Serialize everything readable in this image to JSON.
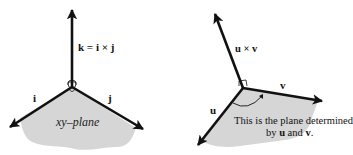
{
  "colors": {
    "ink": "#111111",
    "plane_fill": "#d6d6d6",
    "background": "#ffffff"
  },
  "left_diagram": {
    "vector_k_label": "k = i × j",
    "vector_i_label": "i",
    "vector_j_label": "j",
    "plane_label": "xy–plane"
  },
  "right_diagram": {
    "vector_cross_label": "u × v",
    "vector_u_label": "u",
    "vector_v_label": "v",
    "caption_line1": "This is the plane determined",
    "caption_line2_prefix": "by ",
    "caption_line2_u": "u",
    "caption_line2_mid": " and ",
    "caption_line2_v": "v",
    "caption_line2_suffix": "."
  }
}
